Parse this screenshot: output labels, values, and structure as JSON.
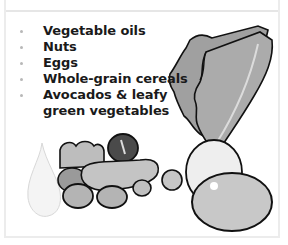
{
  "list": {
    "items": [
      {
        "label": "Vegetable oils",
        "bullet": true
      },
      {
        "label": "Nuts",
        "bullet": true
      },
      {
        "label": "Eggs",
        "bullet": true
      },
      {
        "label": "Whole-grain cereals",
        "bullet": true
      },
      {
        "label": "Avocados & leafy",
        "bullet": true
      },
      {
        "label": "green vegetables",
        "bullet": false
      }
    ]
  },
  "illustration": {
    "elements": [
      "oil-drop",
      "nuts",
      "olive",
      "cucumber",
      "lettuce-leaves",
      "eggs",
      "avocado"
    ],
    "colors": {
      "outline": "#111111",
      "leaf": "#a8a8a8",
      "egg_light": "#eeeeee",
      "egg_gray": "#c8c8c8",
      "nut": "#b4b4b4",
      "drop": "#f4f4f4",
      "frame": "#e6e6e6"
    }
  }
}
